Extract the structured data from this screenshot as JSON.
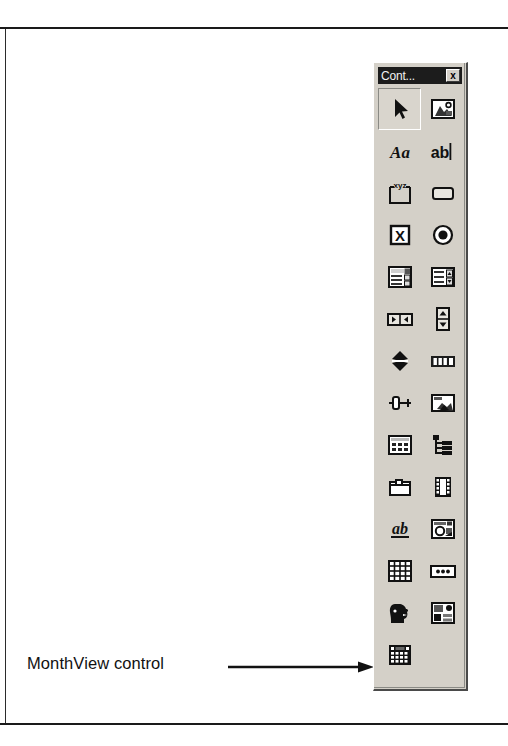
{
  "page": {
    "caption": "MonthView control",
    "arrow_icon": "right-arrow-icon",
    "rule_color": "#1a1a1a"
  },
  "toolbox": {
    "title": "Cont...",
    "close_label": "x",
    "background_color": "#d4d0c8",
    "titlebar_color": "#1c1c1c",
    "columns": 2,
    "rows": 14,
    "tools": [
      {
        "name": "pointer",
        "label": "Pointer",
        "icon": "arrow-pointer-icon",
        "selected": true
      },
      {
        "name": "picturebox",
        "label": "PictureBox",
        "icon": "picture-box-icon",
        "selected": false
      },
      {
        "name": "label",
        "label": "Label",
        "icon": "label-aa-icon",
        "selected": false
      },
      {
        "name": "textbox",
        "label": "TextBox",
        "icon": "textbox-ab-icon",
        "selected": false
      },
      {
        "name": "frame",
        "label": "Frame",
        "icon": "frame-xyz-icon",
        "selected": false
      },
      {
        "name": "commandbutton",
        "label": "CommandButton",
        "icon": "command-button-icon",
        "selected": false
      },
      {
        "name": "checkbox",
        "label": "CheckBox",
        "icon": "checkbox-icon",
        "selected": false
      },
      {
        "name": "optionbutton",
        "label": "OptionButton",
        "icon": "option-button-icon",
        "selected": false
      },
      {
        "name": "combobox",
        "label": "ComboBox",
        "icon": "combo-box-icon",
        "selected": false
      },
      {
        "name": "listbox",
        "label": "ListBox",
        "icon": "list-box-icon",
        "selected": false
      },
      {
        "name": "hscrollbar",
        "label": "HScrollBar",
        "icon": "horizontal-scrollbar-icon",
        "selected": false
      },
      {
        "name": "vscrollbar",
        "label": "VScrollBar",
        "icon": "vertical-scrollbar-icon",
        "selected": false
      },
      {
        "name": "timer",
        "label": "Timer",
        "icon": "timer-icon",
        "selected": false
      },
      {
        "name": "progressbar",
        "label": "ProgressBar",
        "icon": "progress-bar-icon",
        "selected": false
      },
      {
        "name": "slider",
        "label": "Slider",
        "icon": "slider-icon",
        "selected": false
      },
      {
        "name": "imagecombo",
        "label": "ImageCombo",
        "icon": "pointer-hand-panel-icon",
        "selected": false
      },
      {
        "name": "listview",
        "label": "ListView",
        "icon": "list-view-icon",
        "selected": false
      },
      {
        "name": "treeview",
        "label": "TreeView",
        "icon": "tree-view-icon",
        "selected": false
      },
      {
        "name": "tabstrip",
        "label": "TabStrip",
        "icon": "tab-strip-icon",
        "selected": false
      },
      {
        "name": "imagelist",
        "label": "ImageList",
        "icon": "image-list-filmstrip-icon",
        "selected": false
      },
      {
        "name": "richtextbox",
        "label": "RichTextBox",
        "icon": "rich-textbox-ab-icon",
        "selected": false
      },
      {
        "name": "coolbar",
        "label": "CoolBar",
        "icon": "coolbar-icon",
        "selected": false
      },
      {
        "name": "flexgrid",
        "label": "MSFlexGrid",
        "icon": "flex-grid-icon",
        "selected": false
      },
      {
        "name": "statusbar",
        "label": "StatusBar",
        "icon": "status-bar-icon",
        "selected": false
      },
      {
        "name": "animation",
        "label": "Animation",
        "icon": "head-profile-icon",
        "selected": false
      },
      {
        "name": "mmcontrol",
        "label": "Multimedia",
        "icon": "multimedia-panel-icon",
        "selected": false
      },
      {
        "name": "monthview",
        "label": "MonthView",
        "icon": "month-view-calendar-icon",
        "selected": false
      }
    ]
  }
}
